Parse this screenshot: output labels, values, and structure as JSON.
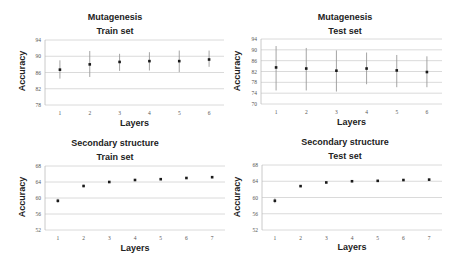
{
  "chart_data": [
    {
      "type": "scatter",
      "title": "Mutagenesis",
      "subtitle": "Train set",
      "xlabel": "Layers",
      "ylabel": "Accuracy",
      "x": [
        1,
        2,
        3,
        4,
        5,
        6
      ],
      "values": [
        86.7,
        88.0,
        88.6,
        88.8,
        88.8,
        89.2
      ],
      "error_low": [
        84.5,
        84.9,
        86.4,
        86.5,
        86.1,
        87.4
      ],
      "error_high": [
        89.0,
        91.3,
        90.6,
        91.0,
        91.4,
        91.4
      ],
      "yticks": [
        78,
        82,
        86,
        90,
        94
      ],
      "ylim": [
        78,
        94
      ],
      "grid": true
    },
    {
      "type": "scatter",
      "title": "Mutagenesis",
      "subtitle": "Test set",
      "xlabel": "Layers",
      "ylabel": "Accuracy",
      "x": [
        1,
        2,
        3,
        4,
        5,
        6
      ],
      "values": [
        83.5,
        83.1,
        82.3,
        83.1,
        82.4,
        81.8
      ],
      "error_low": [
        75.0,
        75.0,
        74.6,
        77.3,
        76.2,
        76.2
      ],
      "error_high": [
        91.4,
        90.7,
        89.8,
        89.0,
        88.1,
        87.6
      ],
      "yticks": [
        70,
        74,
        78,
        82,
        86,
        90,
        94
      ],
      "ylim": [
        70,
        94
      ],
      "grid": true
    },
    {
      "type": "scatter",
      "title": "Secondary structure",
      "subtitle": "Train set",
      "xlabel": "Layers",
      "ylabel": "Accuracy",
      "x": [
        1,
        2,
        3,
        4,
        5,
        6,
        7
      ],
      "values": [
        59.3,
        63.0,
        64.0,
        64.5,
        64.7,
        65.0,
        65.2
      ],
      "error_low": [
        58.8,
        62.7,
        63.8,
        64.3,
        64.5,
        64.8,
        65.0
      ],
      "error_high": [
        59.8,
        63.3,
        64.2,
        64.7,
        64.9,
        65.2,
        65.4
      ],
      "yticks": [
        52,
        56,
        60,
        64,
        68
      ],
      "ylim": [
        52,
        68
      ],
      "grid": true
    },
    {
      "type": "scatter",
      "title": "Secondary structure",
      "subtitle": "Test set",
      "xlabel": "Layers",
      "ylabel": "Accuracy",
      "x": [
        1,
        2,
        3,
        4,
        5,
        6,
        7
      ],
      "values": [
        59.2,
        62.8,
        63.7,
        64.0,
        64.1,
        64.3,
        64.4
      ],
      "error_low": [
        58.6,
        62.6,
        63.5,
        63.8,
        63.9,
        64.1,
        64.2
      ],
      "error_high": [
        59.8,
        63.0,
        63.9,
        64.2,
        64.3,
        64.5,
        64.6
      ],
      "yticks": [
        52,
        56,
        60,
        64,
        68
      ],
      "ylim": [
        52,
        68
      ],
      "grid": true
    }
  ],
  "colors": {
    "point": "#1a1a1a",
    "errorbar": "#9a9a9a",
    "grid": "#d0d0d0",
    "axis": "#bdbdbd",
    "text": "#222222"
  }
}
